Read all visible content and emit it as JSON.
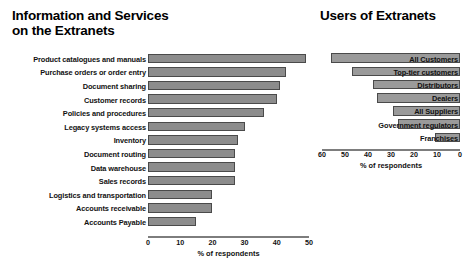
{
  "chart_data": [
    {
      "id": "information-and-services",
      "type": "bar",
      "orientation": "horizontal",
      "title": "Information and Services\non the Extranets",
      "xlabel": "% of respondents",
      "ylabel": "",
      "xlim": [
        0,
        50
      ],
      "xticks": [
        0,
        10,
        20,
        30,
        40,
        50
      ],
      "grid": false,
      "legend": false,
      "bar_color": "#8c8c8c",
      "bar_border_color": "#4a4a4a",
      "categories": [
        "Product catalogues and manuals",
        "Purchase orders or order entry",
        "Document sharing",
        "Customer records",
        "Policies and procedures",
        "Legacy systems access",
        "Inventory",
        "Document routing",
        "Data warehouse",
        "Sales records",
        "Logistics and transportation",
        "Accounts receivable",
        "Accounts Payable"
      ],
      "values": [
        49,
        43,
        41,
        40,
        36,
        30,
        28,
        27,
        27,
        27,
        20,
        20,
        15
      ]
    },
    {
      "id": "users-of-extranets",
      "type": "bar",
      "orientation": "horizontal",
      "direction": "right-to-left",
      "title": "Users of Extranets",
      "xlabel": "% of respondents",
      "ylabel": "",
      "xlim": [
        60,
        0
      ],
      "xticks": [
        60,
        50,
        40,
        30,
        20,
        10,
        0
      ],
      "grid": false,
      "legend": false,
      "bar_color": "#9a9a9a",
      "bar_border_color": "#4a4a4a",
      "categories": [
        "All Customers",
        "Top-tier customers",
        "Distributors",
        "Dealers",
        "All Suppliers",
        "Government regulators",
        "Franchises"
      ],
      "values": [
        56,
        47,
        38,
        36,
        29,
        27,
        11
      ]
    }
  ]
}
